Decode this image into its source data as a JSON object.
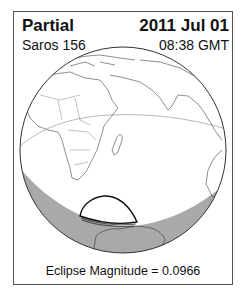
{
  "header": {
    "eclipse_type": "Partial",
    "date": "2011 Jul 01",
    "saros": "Saros 156",
    "time": "08:38 GMT"
  },
  "footer": {
    "magnitude_label": "Eclipse Magnitude = 0.0966"
  },
  "globe": {
    "day_color": "#ffffff",
    "night_color": "#a9a9a9",
    "outline_color": "#333333",
    "eclipse_path_color": "#111111"
  }
}
